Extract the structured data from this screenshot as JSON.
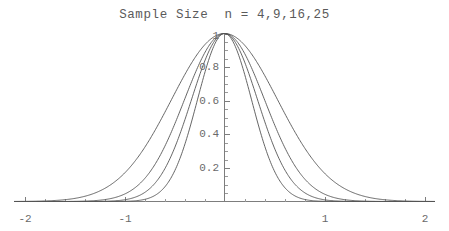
{
  "chart_data": {
    "type": "line",
    "title": "Sample Size  n = 4,9,16,25",
    "xlabel": "",
    "ylabel": "",
    "xlim": [
      -2.1,
      2.1
    ],
    "ylim": [
      0,
      1.0
    ],
    "grid": false,
    "legend_position": "none",
    "x_ticks": [
      -2,
      -1,
      1,
      2
    ],
    "x_tick_labels": [
      "-2",
      "-1",
      "1",
      "2"
    ],
    "y_ticks": [
      0.2,
      0.4,
      0.6,
      0.8,
      1
    ],
    "y_tick_labels": [
      "0.2",
      "0.4",
      "0.6",
      "0.8",
      "1"
    ],
    "x_minor_tick_step": 0.2,
    "y_minor_tick_step": 0.05,
    "series": [
      {
        "name": "n = 4",
        "n": 4,
        "sigma": 0.53,
        "peak_value": 1,
        "half_width_at_half_max": 0.62,
        "color": "#555555"
      },
      {
        "name": "n = 9",
        "n": 9,
        "sigma": 0.4,
        "peak_value": 1,
        "half_width_at_half_max": 0.47,
        "color": "#555555"
      },
      {
        "name": "n = 16",
        "n": 16,
        "sigma": 0.33,
        "peak_value": 1,
        "half_width_at_half_max": 0.39,
        "color": "#555555"
      },
      {
        "name": "n = 25",
        "n": 25,
        "sigma": 0.27,
        "peak_value": 1,
        "half_width_at_half_max": 0.32,
        "color": "#555555"
      }
    ],
    "axis_color": "#7d7d7d",
    "curve_color": "#555555",
    "text_color": "#5a5a5a",
    "background_color": "#ffffff"
  },
  "labels": {
    "x_neg2": "-2",
    "x_neg1": "-1",
    "x_pos1": "1",
    "x_pos2": "2",
    "y_02": "0.2",
    "y_04": "0.4",
    "y_06": "0.6",
    "y_08": "0.8",
    "y_1": "1"
  }
}
